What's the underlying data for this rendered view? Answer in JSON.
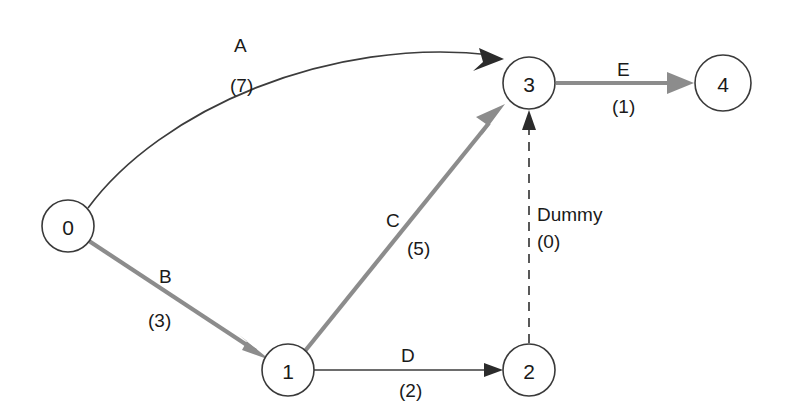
{
  "diagram": {
    "background_color": "#ffffff",
    "node_stroke_color": "#3a3a3a",
    "dark_edge_color": "#3c3c3c",
    "gray_edge_color": "#8c8c8c",
    "nodes": [
      {
        "id": "0",
        "label": "0",
        "cx": 68,
        "cy": 226,
        "r": 26
      },
      {
        "id": "1",
        "label": "1",
        "cx": 288,
        "cy": 370,
        "r": 26
      },
      {
        "id": "2",
        "label": "2",
        "cx": 529,
        "cy": 370,
        "r": 26
      },
      {
        "id": "3",
        "label": "3",
        "cx": 529,
        "cy": 83,
        "r": 26
      },
      {
        "id": "4",
        "label": "4",
        "cx": 723,
        "cy": 83,
        "r": 28
      }
    ],
    "edges": [
      {
        "id": "A",
        "name": "A",
        "duration": "(7)",
        "from": "0",
        "to": "3",
        "style": "curved-thin-dark",
        "color": "#3c3c3c",
        "name_x": 234,
        "name_y": 52,
        "duration_x": 230,
        "duration_y": 92
      },
      {
        "id": "B",
        "name": "B",
        "duration": "(3)",
        "from": "0",
        "to": "1",
        "style": "straight-thick-gray",
        "color": "#8c8c8c",
        "name_x": 159,
        "name_y": 283,
        "duration_x": 148,
        "duration_y": 327
      },
      {
        "id": "C",
        "name": "C",
        "duration": "(5)",
        "from": "1",
        "to": "3",
        "style": "straight-thick-gray",
        "color": "#8c8c8c",
        "name_x": 386,
        "name_y": 227,
        "duration_x": 407,
        "duration_y": 255
      },
      {
        "id": "D",
        "name": "D",
        "duration": "(2)",
        "from": "1",
        "to": "2",
        "style": "straight-thin-dark",
        "color": "#3c3c3c",
        "name_x": 401,
        "name_y": 362,
        "duration_x": 399,
        "duration_y": 397
      },
      {
        "id": "E",
        "name": "E",
        "duration": "(1)",
        "from": "3",
        "to": "4",
        "style": "straight-thick-gray",
        "color": "#8c8c8c",
        "name_x": 617,
        "name_y": 76,
        "duration_x": 612,
        "duration_y": 113
      },
      {
        "id": "Dummy",
        "name": "Dummy",
        "duration": "(0)",
        "from": "2",
        "to": "3",
        "style": "dashed-thin-dark",
        "color": "#3c3c3c",
        "name_x": 537,
        "name_y": 221,
        "duration_x": 537,
        "duration_y": 248
      }
    ]
  }
}
